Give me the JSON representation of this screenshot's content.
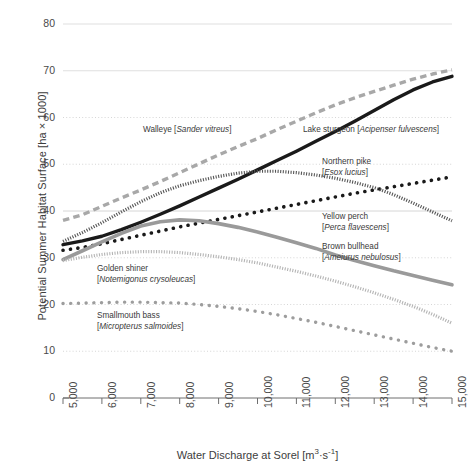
{
  "chart_data": {
    "type": "line",
    "title": "",
    "xlabel": "Water Discharge at Sorel [m³·s⁻¹]",
    "ylabel": "Potential Summer Habitat Surface [ha × 1000]",
    "xlim": [
      5000,
      15000
    ],
    "ylim": [
      0,
      80
    ],
    "xticks": [
      "5,000",
      "6,000",
      "7,000",
      "8,000",
      "9,000",
      "10,000",
      "11,000",
      "12,000",
      "13,000",
      "14,000",
      "15,000"
    ],
    "yticks": [
      "0",
      "10",
      "20",
      "30",
      "40",
      "50",
      "60",
      "70",
      "80"
    ],
    "grid": true,
    "legend": "inline-annotations",
    "x": [
      5000,
      5500,
      6000,
      6500,
      7000,
      7500,
      8000,
      8500,
      9000,
      9500,
      10000,
      10500,
      11000,
      11500,
      12000,
      12500,
      13000,
      13500,
      14000,
      14500,
      15000
    ],
    "series": [
      {
        "name": "Walleye",
        "scientific": "Sander vitreus",
        "style": "dashed",
        "color": "#a8a8a8",
        "values": [
          38.0,
          39.2,
          41.0,
          42.8,
          44.5,
          46.3,
          48.2,
          50.1,
          52.0,
          53.8,
          55.5,
          57.4,
          59.2,
          61.0,
          62.7,
          64.2,
          65.6,
          66.9,
          68.2,
          69.3,
          70.2
        ]
      },
      {
        "name": "Lake sturgeon",
        "scientific": "Acipenser fulvescens",
        "style": "solid",
        "color": "#1a1a1a",
        "values": [
          32.8,
          33.6,
          34.6,
          36.0,
          37.6,
          39.3,
          41.1,
          43.0,
          44.9,
          46.8,
          48.8,
          50.8,
          52.8,
          54.9,
          57.0,
          59.2,
          61.5,
          63.8,
          65.9,
          67.6,
          68.8
        ]
      },
      {
        "name": "Northern pike",
        "scientific": "Esox lucius",
        "style": "dotted-round",
        "color": "#1a1a1a",
        "values": [
          31.6,
          32.2,
          33.0,
          33.9,
          34.8,
          35.7,
          36.6,
          37.4,
          38.2,
          39.0,
          39.8,
          40.6,
          41.4,
          42.2,
          43.0,
          43.8,
          44.5,
          45.2,
          45.9,
          46.6,
          47.3
        ]
      },
      {
        "name": "Yellow perch",
        "scientific": "Perca flavescens",
        "style": "hatched-dark",
        "color": "#555555",
        "values": [
          33.5,
          35.4,
          37.5,
          39.8,
          42.0,
          43.9,
          45.4,
          46.5,
          47.4,
          48.1,
          48.5,
          48.5,
          48.2,
          47.7,
          47.0,
          46.1,
          45.0,
          43.5,
          41.7,
          39.8,
          37.9
        ]
      },
      {
        "name": "Brown bullhead",
        "scientific": "Ameiurus nebulosus",
        "style": "solid-thick",
        "color": "#9a9a9a",
        "values": [
          29.6,
          31.5,
          33.4,
          35.2,
          36.8,
          37.7,
          38.1,
          37.9,
          37.3,
          36.5,
          35.5,
          34.4,
          33.2,
          32.0,
          30.6,
          29.4,
          28.3,
          27.2,
          26.2,
          25.2,
          24.2
        ]
      },
      {
        "name": "Golden shiner",
        "scientific": "Notemigonus crysoleucas",
        "style": "hatched-light",
        "color": "#b4b4b4",
        "values": [
          29.4,
          30.1,
          30.7,
          31.1,
          31.3,
          31.3,
          31.1,
          30.7,
          30.2,
          29.6,
          28.9,
          28.0,
          27.1,
          26.1,
          25.0,
          23.8,
          22.5,
          21.1,
          19.6,
          17.9,
          16.0
        ]
      },
      {
        "name": "Smallmouth bass",
        "scientific": "Micropterus salmoides",
        "style": "dotted-round-gray",
        "color": "#9d9d9d",
        "values": [
          20.2,
          20.3,
          20.4,
          20.5,
          20.5,
          20.4,
          20.3,
          20.0,
          19.6,
          19.1,
          18.5,
          17.8,
          17.0,
          16.2,
          15.3,
          14.4,
          13.5,
          12.6,
          11.7,
          10.8,
          10.0
        ]
      }
    ],
    "annotations": [
      {
        "id": "walleye",
        "name": "Walleye",
        "scientific": "Sander vitreus",
        "x": 143,
        "y": 125
      },
      {
        "id": "lake-sturgeon",
        "name": "Lake sturgeon",
        "scientific": "Acipenser fulvescens",
        "x": 303,
        "y": 125
      },
      {
        "id": "northern-pike",
        "name": "Northern pike",
        "scientific": "Esox lucius",
        "x": 322,
        "y": 157
      },
      {
        "id": "yellow-perch",
        "name": "Yellow perch",
        "scientific": "Perca flavescens",
        "x": 322,
        "y": 212
      },
      {
        "id": "brown-bullhead",
        "name": "Brown bullhead",
        "scientific": "Ameiurus nebulosus",
        "x": 322,
        "y": 242
      },
      {
        "id": "golden-shiner",
        "name": "Golden shiner",
        "scientific": "Notemigonus crysoleucas",
        "x": 97,
        "y": 264
      },
      {
        "id": "smallmouth-bass",
        "name": "Smallmouth bass",
        "scientific": "Micropterus salmoides",
        "x": 97,
        "y": 311
      }
    ]
  }
}
